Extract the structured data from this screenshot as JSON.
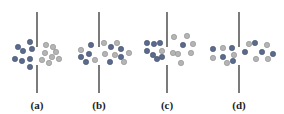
{
  "figure": {
    "title": "",
    "colors": {
      "dark": "#5a6a8c",
      "light": "#b4b4b4",
      "line": "#333333",
      "light_stroke": "#8e8e8e",
      "dark_stroke": "#3f4b66"
    },
    "panels": [
      {
        "label": "(a)",
        "line_x": 37,
        "line_top": [
          12,
          47
        ],
        "line_bottom": [
          65,
          93
        ],
        "dark": [
          [
            18,
            47
          ],
          [
            23,
            51
          ],
          [
            30,
            42
          ],
          [
            32,
            49
          ],
          [
            15,
            59
          ],
          [
            22,
            61
          ],
          [
            30,
            59
          ],
          [
            30,
            67
          ]
        ],
        "light": [
          [
            46,
            45
          ],
          [
            53,
            47
          ],
          [
            45,
            53
          ],
          [
            56,
            52
          ],
          [
            52,
            57
          ],
          [
            42,
            60
          ],
          [
            49,
            63
          ],
          [
            59,
            59
          ]
        ]
      },
      {
        "label": "(b)",
        "line_x": 99,
        "line_top": [
          12,
          47
        ],
        "line_bottom": [
          65,
          93
        ],
        "dark": [
          [
            91,
            45
          ],
          [
            111,
            47
          ],
          [
            89,
            54
          ],
          [
            81,
            57
          ],
          [
            86,
            62
          ],
          [
            121,
            49
          ],
          [
            121,
            57
          ],
          [
            110,
            62
          ]
        ],
        "light": [
          [
            81,
            50
          ],
          [
            104,
            43
          ],
          [
            117,
            43
          ],
          [
            95,
            60
          ],
          [
            105,
            54
          ],
          [
            115,
            55
          ],
          [
            129,
            53
          ],
          [
            124,
            62
          ]
        ]
      },
      {
        "label": "(c)",
        "line_x": 167,
        "line_top": [
          12,
          47
        ],
        "line_bottom": [
          65,
          93
        ],
        "dark": [
          [
            147,
            43
          ],
          [
            154,
            44
          ],
          [
            160,
            43
          ],
          [
            147,
            51
          ],
          [
            153,
            55
          ],
          [
            157,
            59
          ],
          [
            162,
            57
          ],
          [
            183,
            45
          ]
        ],
        "light": [
          [
            162,
            51
          ],
          [
            174,
            37
          ],
          [
            187,
            36
          ],
          [
            193,
            44
          ],
          [
            173,
            53
          ],
          [
            178,
            54
          ],
          [
            191,
            53
          ],
          [
            181,
            63
          ]
        ]
      },
      {
        "label": "(d)",
        "line_x": 239,
        "line_top": [
          12,
          47
        ],
        "line_bottom": [
          65,
          93
        ],
        "dark": [
          [
            213,
            49
          ],
          [
            232,
            48
          ],
          [
            223,
            57
          ],
          [
            233,
            61
          ],
          [
            245,
            52
          ],
          [
            255,
            43
          ],
          [
            262,
            52
          ],
          [
            273,
            54
          ]
        ],
        "light": [
          [
            223,
            48
          ],
          [
            213,
            58
          ],
          [
            227,
            63
          ],
          [
            234,
            55
          ],
          [
            249,
            44
          ],
          [
            267,
            45
          ],
          [
            256,
            59
          ],
          [
            268,
            59
          ]
        ]
      }
    ]
  }
}
